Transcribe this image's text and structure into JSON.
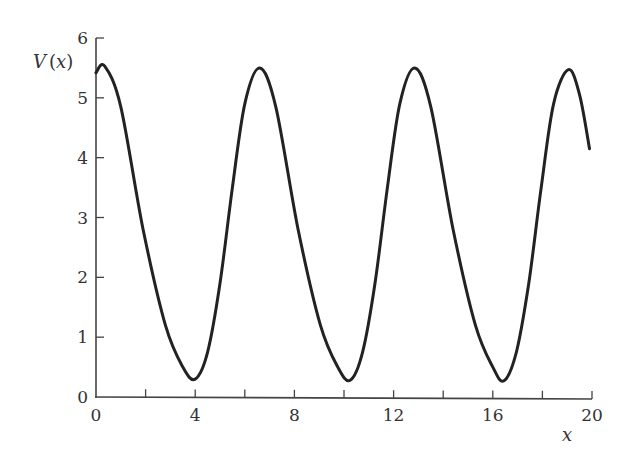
{
  "chart_data": {
    "type": "line",
    "title": "",
    "xlabel": "x",
    "ylabel": "V(x)",
    "xlim": [
      0,
      20
    ],
    "ylim": [
      0,
      6
    ],
    "grid": false,
    "legend": null,
    "x_ticks_major": [
      0,
      4,
      8,
      12,
      16,
      20
    ],
    "x_ticks_minor": [
      2,
      6,
      10,
      14,
      18
    ],
    "y_ticks": [
      0,
      1,
      2,
      3,
      4,
      5,
      6
    ],
    "x_tick_labels": [
      "0",
      "4",
      "8",
      "12",
      "16",
      "20"
    ],
    "y_tick_labels": [
      "0",
      "1",
      "2",
      "3",
      "4",
      "5",
      "6"
    ],
    "series": [
      {
        "name": "V(x)",
        "color": "#222222",
        "description": "Periodic, asymmetric oscillation: period ~6.25; maxima ~5.5, minima ~0.28",
        "x": [
          0,
          0.35,
          1.0,
          1.9,
          2.8,
          3.5,
          4.0,
          4.5,
          5.0,
          5.5,
          6.0,
          6.6,
          7.25,
          8.15,
          9.05,
          9.75,
          10.25,
          10.75,
          11.25,
          11.75,
          12.25,
          12.85,
          13.5,
          14.4,
          15.3,
          16.0,
          16.45,
          16.95,
          17.45,
          17.95,
          18.45,
          19.05,
          19.5,
          19.9
        ],
        "y": [
          5.42,
          5.53,
          4.85,
          2.8,
          1.2,
          0.5,
          0.3,
          0.75,
          1.9,
          3.5,
          4.9,
          5.5,
          4.85,
          2.8,
          1.2,
          0.5,
          0.28,
          0.75,
          1.9,
          3.5,
          4.9,
          5.5,
          4.85,
          2.8,
          1.2,
          0.5,
          0.27,
          0.75,
          1.9,
          3.5,
          4.9,
          5.47,
          5.05,
          4.15
        ]
      }
    ],
    "extrema": {
      "maxima": [
        {
          "x": 0.35,
          "y": 5.53
        },
        {
          "x": 6.6,
          "y": 5.5
        },
        {
          "x": 12.85,
          "y": 5.5
        },
        {
          "x": 19.05,
          "y": 5.47
        }
      ],
      "minima": [
        {
          "x": 4.0,
          "y": 0.3
        },
        {
          "x": 10.25,
          "y": 0.28
        },
        {
          "x": 16.45,
          "y": 0.27
        }
      ]
    }
  },
  "labels": {
    "y_axis": "V(x)",
    "y_axis_v": "V",
    "y_axis_open": "(",
    "y_axis_var": "x",
    "y_axis_close": ")",
    "x_axis": "x"
  }
}
